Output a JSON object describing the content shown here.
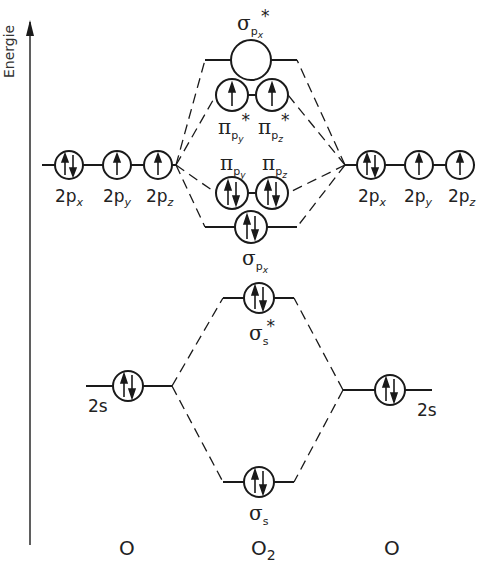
{
  "axis": {
    "label": "Energie"
  },
  "atoms": {
    "left": {
      "name": "O",
      "p_labels": [
        "2p",
        "2p",
        "2p"
      ],
      "p_subs": [
        "x",
        "y",
        "z"
      ],
      "s_label": "2s"
    },
    "right": {
      "name": "O",
      "p_labels": [
        "2p",
        "2p",
        "2p"
      ],
      "p_subs": [
        "x",
        "y",
        "z"
      ],
      "s_label": "2s"
    }
  },
  "molecule": {
    "name": "O",
    "name_sub": "2",
    "orbitals": {
      "sigma_px_star": {
        "symbol": "σ",
        "sub": "p",
        "subsub": "x",
        "star": "*",
        "electrons": 0
      },
      "pi_py_star": {
        "symbol": "π",
        "sub": "p",
        "subsub": "y",
        "star": "*",
        "electrons": 1
      },
      "pi_pz_star": {
        "symbol": "π",
        "sub": "p",
        "subsub": "z",
        "star": "*",
        "electrons": 1
      },
      "pi_py": {
        "symbol": "π",
        "sub": "p",
        "subsub": "y",
        "electrons": 2
      },
      "pi_pz": {
        "symbol": "π",
        "sub": "p",
        "subsub": "z",
        "electrons": 2
      },
      "sigma_px": {
        "symbol": "σ",
        "sub": "p",
        "subsub": "x",
        "electrons": 2
      },
      "sigma_s_star": {
        "symbol": "σ",
        "sub": "s",
        "star": "*",
        "electrons": 2
      },
      "sigma_s": {
        "symbol": "σ",
        "sub": "s",
        "electrons": 2
      }
    }
  },
  "colors": {
    "line": "#1a1a1a",
    "background": "#ffffff"
  }
}
